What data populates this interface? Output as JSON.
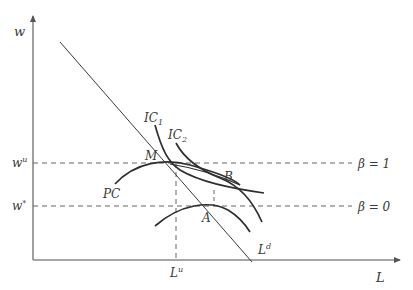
{
  "diagram": {
    "axes": {
      "y_label": "w",
      "x_label": "L"
    },
    "wage_levels": {
      "w_u": {
        "base": "w",
        "sup": "u",
        "beta_label": "β = 1"
      },
      "w_star": {
        "base": "w",
        "sup": "*",
        "beta_label": "β = 0"
      }
    },
    "employment_level": {
      "base": "L",
      "sup": "u"
    },
    "labor_demand": {
      "base": "L",
      "sup": "d"
    },
    "curves": {
      "ic1": {
        "base": "IC",
        "sub": "1"
      },
      "ic2": {
        "base": "IC",
        "sub": "2"
      },
      "pc": "PC"
    },
    "points": {
      "M": "M",
      "A": "A",
      "B": "B"
    },
    "colors": {
      "line": "#3a3a3a",
      "axis": "#7a7a7a",
      "dash": "#555555"
    }
  }
}
